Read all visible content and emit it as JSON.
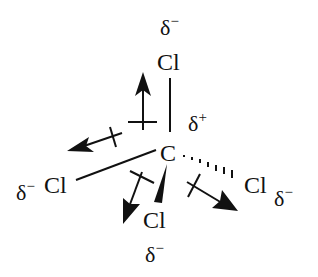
{
  "diagram": {
    "central_atom": {
      "symbol": "C",
      "charge": "δ",
      "charge_sign": "+"
    },
    "substituents": [
      {
        "id": "top",
        "symbol": "Cl",
        "charge": "δ",
        "charge_sign": "−",
        "bond": "plain"
      },
      {
        "id": "left",
        "symbol": "Cl",
        "charge": "δ",
        "charge_sign": "−",
        "bond": "plain"
      },
      {
        "id": "bottom",
        "symbol": "Cl",
        "charge": "δ",
        "charge_sign": "−",
        "bond": "wedge"
      },
      {
        "id": "right",
        "symbol": "Cl",
        "charge": "δ",
        "charge_sign": "−",
        "bond": "hash"
      }
    ],
    "dipole_arrows": 4,
    "colors": {
      "ink": "#111111",
      "background": "#ffffff"
    }
  }
}
